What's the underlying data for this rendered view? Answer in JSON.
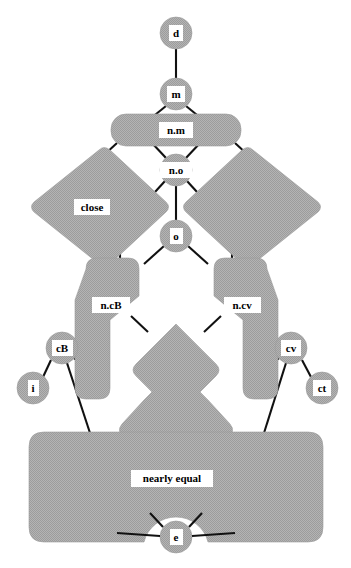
{
  "diagram": {
    "type": "hasse-lattice",
    "canvas": {
      "width": 351,
      "height": 568
    },
    "colors": {
      "node_fill": "#a8a8a8",
      "node_stroke": "#9a9a9a",
      "edge": "#111111",
      "label_bg": "#ffffff",
      "label_text": "#000000",
      "background": "#ffffff"
    },
    "nodes": [
      {
        "id": "d",
        "label": "d",
        "shape": "circle",
        "cx": 176,
        "cy": 33,
        "r": 16
      },
      {
        "id": "m",
        "label": "m",
        "shape": "circle",
        "cx": 176,
        "cy": 94,
        "r": 16
      },
      {
        "id": "n_m",
        "label": "n.m",
        "shape": "rounded-rect-wide",
        "cx": 176,
        "cy": 130
      },
      {
        "id": "n_o",
        "label": "n.o",
        "shape": "circle",
        "cx": 176,
        "cy": 170,
        "r": 16
      },
      {
        "id": "close",
        "label": "close",
        "shape": "diamond-left",
        "cx": 95,
        "cy": 207
      },
      {
        "id": "right_diamond",
        "label": "",
        "shape": "diamond-right",
        "cx": 257,
        "cy": 207
      },
      {
        "id": "o",
        "label": "o",
        "shape": "circle",
        "cx": 176,
        "cy": 236,
        "r": 16
      },
      {
        "id": "n_cB",
        "label": "n.cB",
        "shape": "bar-left",
        "cx": 112,
        "cy": 305
      },
      {
        "id": "n_cv",
        "label": "n.cv",
        "shape": "bar-right",
        "cx": 242,
        "cy": 305
      },
      {
        "id": "center_blob",
        "label": "",
        "shape": "center-blob",
        "cx": 176,
        "cy": 380
      },
      {
        "id": "cB",
        "label": "cB",
        "shape": "circle",
        "cx": 62,
        "cy": 348,
        "r": 16
      },
      {
        "id": "cv",
        "label": "cv",
        "shape": "circle",
        "cx": 291,
        "cy": 348,
        "r": 16
      },
      {
        "id": "i",
        "label": "i",
        "shape": "circle",
        "cx": 33,
        "cy": 388,
        "r": 16
      },
      {
        "id": "ct",
        "label": "ct",
        "shape": "circle",
        "cx": 322,
        "cy": 388,
        "r": 16
      },
      {
        "id": "nearly_equal",
        "label": "nearly equal",
        "shape": "bottom-rect",
        "cx": 176,
        "cy": 478
      },
      {
        "id": "e",
        "label": "e",
        "shape": "circle",
        "cx": 176,
        "cy": 537,
        "r": 16
      }
    ],
    "edges": [
      {
        "from": "d",
        "to": "m"
      },
      {
        "from": "m",
        "to": "n_m_left"
      },
      {
        "from": "m",
        "to": "n_m_right"
      },
      {
        "from": "n_m",
        "to": "n_o_left"
      },
      {
        "from": "n_m",
        "to": "n_o_right"
      },
      {
        "from": "n_m",
        "to": "close_top"
      },
      {
        "from": "n_m",
        "to": "right_diamond_top"
      },
      {
        "from": "n_o",
        "to": "close_inner"
      },
      {
        "from": "n_o",
        "to": "right_inner"
      },
      {
        "from": "n_o",
        "to": "o"
      },
      {
        "from": "o",
        "to": "n_cB"
      },
      {
        "from": "o",
        "to": "n_cv"
      },
      {
        "from": "close",
        "to": "n_cB_outer"
      },
      {
        "from": "right_diamond",
        "to": "n_cv_outer"
      },
      {
        "from": "n_cB",
        "to": "cB"
      },
      {
        "from": "n_cB",
        "to": "center_blob_left"
      },
      {
        "from": "n_cv",
        "to": "cv"
      },
      {
        "from": "n_cv",
        "to": "center_blob_right"
      },
      {
        "from": "cB",
        "to": "i"
      },
      {
        "from": "cB",
        "to": "nearly_equal_left"
      },
      {
        "from": "cB",
        "to": "n_cB_lower"
      },
      {
        "from": "cv",
        "to": "ct"
      },
      {
        "from": "cv",
        "to": "nearly_equal_right"
      },
      {
        "from": "cv",
        "to": "n_cv_lower"
      },
      {
        "from": "center_blob",
        "to": "nearly_equal"
      },
      {
        "from": "nearly_equal",
        "to": "e_left"
      },
      {
        "from": "nearly_equal",
        "to": "e_right"
      },
      {
        "from": "e",
        "to": "e_far_left"
      },
      {
        "from": "e",
        "to": "e_far_right"
      }
    ],
    "labels": {
      "d": "d",
      "m": "m",
      "n_m": "n.m",
      "n_o": "n.o",
      "close": "close",
      "o": "o",
      "n_cB": "n.cB",
      "n_cv": "n.cv",
      "cB": "cB",
      "cv": "cv",
      "i": "i",
      "ct": "ct",
      "nearly_equal": "nearly equal",
      "e": "e"
    }
  }
}
